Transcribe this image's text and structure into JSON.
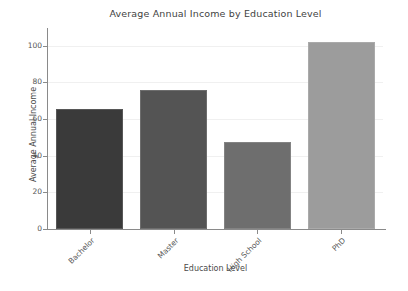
{
  "chart_data": {
    "type": "bar",
    "title": "Average Annual Income by Education Level",
    "xlabel": "Education Level",
    "ylabel": "Average Annual Income",
    "categories": [
      "Bachelor",
      "Master",
      "High School",
      "PhD"
    ],
    "values": [
      65.5,
      76,
      47.5,
      102
    ],
    "bar_colors": [
      "#3a3a3a",
      "#545454",
      "#6e6e6e",
      "#9c9c9c"
    ],
    "ylim": [
      0,
      108
    ],
    "yticks": [
      0,
      20,
      40,
      60,
      80,
      100
    ],
    "ytick_labels": [
      "0",
      "20",
      "40",
      "60",
      "80",
      "100"
    ],
    "grid": true,
    "grid_color": "#f0f0f0",
    "legend": null,
    "background": "#ffffff",
    "axis_color": "#8a8a8a",
    "text_color": "#4d4d4d"
  },
  "figure": {
    "title": "Average Annual Income by Education Level",
    "x_axis_title": "Education Level",
    "y_axis_title": "Average Annual Income"
  }
}
